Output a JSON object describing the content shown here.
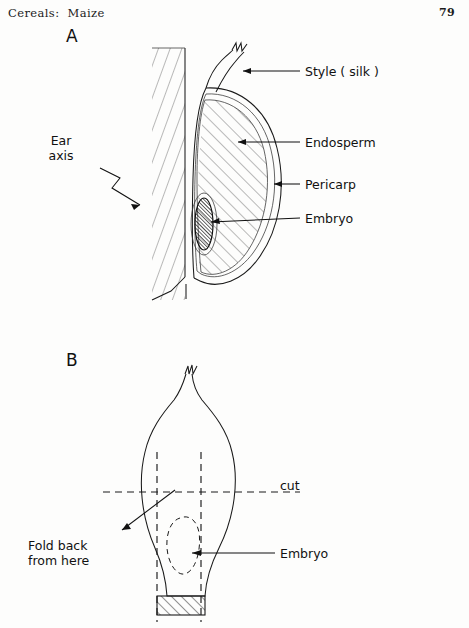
{
  "header": {
    "title": "Cereals:  Maize",
    "page_number": "79"
  },
  "figures": [
    {
      "letter": "A",
      "caption_letter": "A",
      "labels": {
        "style": "Style ( silk )",
        "endosperm": "Endosperm",
        "pericarp": "Pericarp",
        "embryo": "Embryo",
        "ear_axis_line1": "Ear",
        "ear_axis_line2": "axis"
      }
    },
    {
      "letter": "B",
      "caption_letter": "B",
      "labels": {
        "cut": "cut",
        "embryo": "Embryo",
        "fold_line1": "Fold back",
        "fold_line2": "from here"
      }
    }
  ],
  "figure_a": {
    "letter": "A",
    "label_style": "Style ( silk )",
    "label_endosperm": "Endosperm",
    "label_pericarp": "Pericarp",
    "label_embryo": "Embryo",
    "label_ear_axis": "Ear\naxis"
  },
  "figure_b": {
    "letter": "B",
    "label_cut": "cut",
    "label_embryo": "Embryo",
    "label_fold_back": "Fold back\nfrom here"
  },
  "colors": {
    "ink": "#1a1a1a",
    "paper": "#fdfdfc",
    "hatch": "#3a3a3a"
  }
}
